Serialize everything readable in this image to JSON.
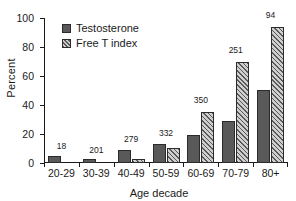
{
  "chart_data": {
    "type": "bar",
    "title": "",
    "xlabel": "Age decade",
    "ylabel": "Percent",
    "ylim": [
      0,
      100
    ],
    "yticks": [
      0,
      20,
      40,
      60,
      80,
      100
    ],
    "grid": false,
    "legend_position": "upper-left-inside",
    "categories": [
      "20-29",
      "30-39",
      "40-49",
      "50-59",
      "60-69",
      "70-79",
      "80+"
    ],
    "series": [
      {
        "name": "Testosterone",
        "style": "solid dark gray",
        "color": "#595959",
        "values": [
          5,
          2.5,
          9,
          13,
          19.5,
          29,
          50.5
        ]
      },
      {
        "name": "Free T index",
        "style": "diagonal hatch",
        "color": "#c9c9c9",
        "values": [
          0,
          0,
          3,
          10.5,
          35.5,
          70,
          93.5
        ]
      }
    ],
    "group_annotations": {
      "note": "sample size n above each age-decade group",
      "values": [
        "18",
        "201",
        "279",
        "332",
        "350",
        "251",
        "94"
      ]
    },
    "annotation_y": [
      8,
      5.5,
      13,
      17,
      40,
      74,
      98
    ]
  },
  "axis": {
    "y_title": "Percent",
    "x_title": "Age decade"
  },
  "legend": {
    "items": [
      {
        "label": "Testosterone",
        "swatch": "solid"
      },
      {
        "label": "Free T index",
        "swatch": "hatch"
      }
    ]
  }
}
